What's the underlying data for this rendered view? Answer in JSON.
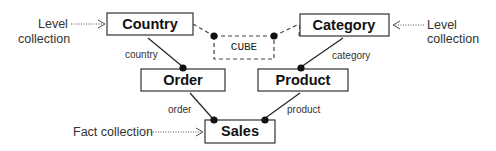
{
  "diagram": {
    "nodes": {
      "country": {
        "label": "Country",
        "kind": "level"
      },
      "category": {
        "label": "Category",
        "kind": "level"
      },
      "order": {
        "label": "Order",
        "kind": "intermediate"
      },
      "product": {
        "label": "Product",
        "kind": "intermediate"
      },
      "sales": {
        "label": "Sales",
        "kind": "fact"
      },
      "cube": {
        "label": "CUBE",
        "kind": "cube"
      }
    },
    "edges": {
      "country_order": {
        "label": "country"
      },
      "category_product": {
        "label": "category"
      },
      "order_sales": {
        "label": "order"
      },
      "product_sales": {
        "label": "product"
      }
    },
    "annotations": {
      "left_level": {
        "line1": "Level",
        "line2": "collection"
      },
      "right_level": {
        "line1": "Level",
        "line2": "collection"
      },
      "fact": {
        "text": "Fact collection"
      }
    }
  }
}
